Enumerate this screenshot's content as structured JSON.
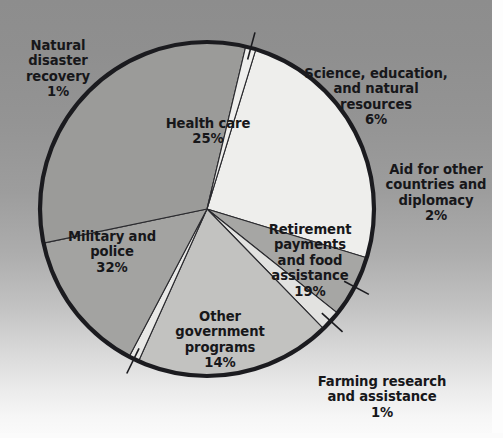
{
  "chart_data": {
    "type": "pie",
    "title": "",
    "subtitle": "",
    "xlabel": "",
    "ylabel": "",
    "legend_position": "none",
    "grid": false,
    "units": "percent",
    "total": 100,
    "start_angle_deg": -73,
    "direction": "clockwise",
    "categories": [
      "Health care",
      "Science, education, and natural resources",
      "Aid for other countries and diplomacy",
      "Retirement payments and food assistance",
      "Farming research and assistance",
      "Other government programs",
      "Military and police",
      "Natural disaster recovery"
    ],
    "values": [
      25,
      6,
      2,
      19,
      1,
      14,
      32,
      1
    ],
    "slices": [
      {
        "id": "health-care",
        "label": "Health care",
        "value": 25,
        "value_text": "25%",
        "color": "#eeeeec",
        "label_placement": "inside",
        "leader_line": false
      },
      {
        "id": "science-education",
        "label": "Science, education,\nand natural\nresources",
        "value": 6,
        "value_text": "6%",
        "color": "#a6a6a4",
        "label_placement": "outside",
        "leader_line": true
      },
      {
        "id": "aid-other-countries",
        "label": "Aid for other\ncountries and\ndiplomacy",
        "value": 2,
        "value_text": "2%",
        "color": "#e2e2e0",
        "label_placement": "outside",
        "leader_line": true
      },
      {
        "id": "retirement-food",
        "label": "Retirement\npayments\nand food\nassistance",
        "value": 19,
        "value_text": "19%",
        "color": "#c2c2c0",
        "label_placement": "inside",
        "leader_line": false
      },
      {
        "id": "farming-research",
        "label": "Farming research\nand assistance",
        "value": 1,
        "value_text": "1%",
        "color": "#e8e8e6",
        "label_placement": "outside",
        "leader_line": true
      },
      {
        "id": "other-government",
        "label": "Other\ngovernment\nprograms",
        "value": 14,
        "value_text": "14%",
        "color": "#a3a3a1",
        "label_placement": "inside",
        "leader_line": false
      },
      {
        "id": "military-police",
        "label": "Military and\npolice",
        "value": 32,
        "value_text": "32%",
        "color": "#9b9b99",
        "label_placement": "inside",
        "leader_line": false
      },
      {
        "id": "natural-disaster",
        "label": "Natural\ndisaster\nrecovery",
        "value": 1,
        "value_text": "1%",
        "color": "#efefed",
        "label_placement": "outside",
        "leader_line": true
      }
    ]
  },
  "labels": {
    "natural_disaster": {
      "name": "Natural\ndisaster\nrecovery",
      "pct": "1%"
    },
    "science": {
      "name": "Science, education,\nand natural\nresources",
      "pct": "6%"
    },
    "aid": {
      "name": "Aid for other\ncountries and\ndiplomacy",
      "pct": "2%"
    },
    "farming": {
      "name": "Farming research\nand assistance",
      "pct": "1%"
    },
    "health_care": {
      "name": "Health care",
      "pct": "25%"
    },
    "military": {
      "name": "Military and\npolice",
      "pct": "32%"
    },
    "retirement": {
      "name": "Retirement\npayments\nand food\nassistance",
      "pct": "19%"
    },
    "other_gov": {
      "name": "Other\ngovernment\nprograms",
      "pct": "14%"
    }
  },
  "style": {
    "outline_color": "#1b1b1f",
    "text_color": "#17171a",
    "background_top": "#8d8d8d",
    "background_bottom": "#fbfbfb"
  }
}
